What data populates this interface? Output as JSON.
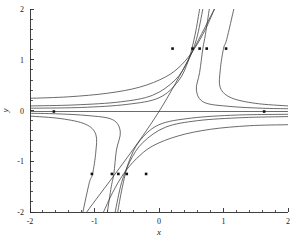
{
  "figure": {
    "background_color": "#ffffff",
    "curve_color": "#3a3a3a",
    "axis_color": "#2a2a2a",
    "marker_color": "#111111"
  },
  "chart_data": {
    "type": "line",
    "title": "",
    "subtitle": "",
    "xlabel": "x",
    "ylabel": "y",
    "xlim": [
      -2,
      2
    ],
    "ylim": [
      -2,
      2
    ],
    "grid": false,
    "legend": "none",
    "x_ticks": [
      -2,
      -1,
      0,
      1,
      2
    ],
    "x_tick_labels": [
      "-2",
      "-1",
      "0",
      "1",
      "2"
    ],
    "y_ticks": [
      -2,
      -1,
      0,
      1,
      2
    ],
    "y_tick_labels": [
      "-2",
      "-1",
      "0",
      "1",
      "2"
    ],
    "x_minor_tick_count": 4,
    "y_minor_tick_count": 4,
    "series": [
      {
        "name": "separatrix-horizontal",
        "kind": "line",
        "points": [
          [
            -2,
            -0.02
          ],
          [
            2,
            -0.02
          ]
        ]
      },
      {
        "name": "separatrix-diagonal",
        "kind": "line",
        "points": [
          [
            -1.12,
            -2.0
          ],
          [
            0.0,
            -0.02
          ],
          [
            0.86,
            2.0
          ]
        ]
      },
      {
        "name": "upper-branch-1",
        "kind": "curve",
        "points": [
          [
            -2.0,
            0.24
          ],
          [
            -1.4,
            0.27
          ],
          [
            -0.8,
            0.34
          ],
          [
            -0.3,
            0.46
          ],
          [
            0.1,
            0.66
          ],
          [
            0.35,
            0.9
          ],
          [
            0.55,
            1.22
          ],
          [
            0.72,
            1.6
          ],
          [
            0.86,
            2.0
          ]
        ]
      },
      {
        "name": "upper-branch-2",
        "kind": "curve",
        "points": [
          [
            -2.0,
            0.09
          ],
          [
            -1.3,
            0.11
          ],
          [
            -0.6,
            0.17
          ],
          [
            -0.1,
            0.3
          ],
          [
            0.25,
            0.6
          ],
          [
            0.45,
            0.98
          ],
          [
            0.58,
            1.4
          ],
          [
            0.68,
            2.0
          ]
        ]
      },
      {
        "name": "upper-branch-3",
        "kind": "curve",
        "points": [
          [
            -2.0,
            0.045
          ],
          [
            -1.2,
            0.06
          ],
          [
            -0.5,
            0.12
          ],
          [
            0.0,
            0.25
          ],
          [
            0.3,
            0.58
          ],
          [
            0.46,
            1.0
          ],
          [
            0.56,
            1.5
          ],
          [
            0.63,
            2.0
          ]
        ]
      },
      {
        "name": "right-hook-1",
        "kind": "curve",
        "points": [
          [
            0.78,
            2.0
          ],
          [
            0.72,
            1.5
          ],
          [
            0.68,
            1.22
          ],
          [
            0.63,
            0.75
          ],
          [
            0.58,
            0.4
          ],
          [
            0.7,
            0.16
          ],
          [
            1.1,
            0.08
          ],
          [
            1.6,
            0.045
          ],
          [
            2.0,
            0.035
          ]
        ]
      },
      {
        "name": "right-hook-2",
        "kind": "curve",
        "points": [
          [
            1.16,
            2.0
          ],
          [
            1.05,
            1.4
          ],
          [
            1.0,
            1.22
          ],
          [
            0.95,
            0.8
          ],
          [
            0.95,
            0.45
          ],
          [
            1.12,
            0.25
          ],
          [
            1.5,
            0.14
          ],
          [
            2.0,
            0.09
          ]
        ]
      },
      {
        "name": "lower-branch-1",
        "kind": "curve",
        "points": [
          [
            2.0,
            -0.28
          ],
          [
            1.4,
            -0.3
          ],
          [
            0.8,
            -0.37
          ],
          [
            0.3,
            -0.5
          ],
          [
            -0.1,
            -0.7
          ],
          [
            -0.35,
            -0.95
          ],
          [
            -0.55,
            -1.25
          ],
          [
            -0.72,
            -1.62
          ],
          [
            -0.86,
            -2.0
          ]
        ]
      },
      {
        "name": "lower-branch-2",
        "kind": "curve",
        "points": [
          [
            2.0,
            -0.12
          ],
          [
            1.3,
            -0.14
          ],
          [
            0.6,
            -0.2
          ],
          [
            0.1,
            -0.33
          ],
          [
            -0.25,
            -0.63
          ],
          [
            -0.45,
            -1.0
          ],
          [
            -0.58,
            -1.42
          ],
          [
            -0.68,
            -2.0
          ]
        ]
      },
      {
        "name": "lower-branch-3",
        "kind": "curve",
        "points": [
          [
            2.0,
            -0.075
          ],
          [
            1.2,
            -0.09
          ],
          [
            0.5,
            -0.15
          ],
          [
            0.0,
            -0.28
          ],
          [
            -0.3,
            -0.6
          ],
          [
            -0.47,
            -1.02
          ],
          [
            -0.57,
            -1.52
          ],
          [
            -0.64,
            -2.0
          ]
        ]
      },
      {
        "name": "left-hook-1",
        "kind": "curve",
        "points": [
          [
            -0.8,
            -2.0
          ],
          [
            -0.74,
            -1.5
          ],
          [
            -0.7,
            -1.25
          ],
          [
            -0.66,
            -0.78
          ],
          [
            -0.6,
            -0.42
          ],
          [
            -0.72,
            -0.18
          ],
          [
            -1.1,
            -0.1
          ],
          [
            -1.6,
            -0.065
          ],
          [
            -2.0,
            -0.055
          ]
        ]
      },
      {
        "name": "left-hook-2",
        "kind": "curve",
        "points": [
          [
            -1.18,
            -2.0
          ],
          [
            -1.08,
            -1.42
          ],
          [
            -1.03,
            -1.25
          ],
          [
            -0.98,
            -0.82
          ],
          [
            -0.98,
            -0.47
          ],
          [
            -1.14,
            -0.27
          ],
          [
            -1.52,
            -0.16
          ],
          [
            -2.0,
            -0.11
          ]
        ]
      }
    ],
    "markers": [
      {
        "x": 0.21,
        "y": 1.22
      },
      {
        "x": 0.52,
        "y": 1.22
      },
      {
        "x": 0.63,
        "y": 1.22
      },
      {
        "x": 0.74,
        "y": 1.22
      },
      {
        "x": 1.04,
        "y": 1.22
      },
      {
        "x": -1.63,
        "y": -0.02
      },
      {
        "x": 1.63,
        "y": -0.02
      },
      {
        "x": -1.04,
        "y": -1.25
      },
      {
        "x": -0.73,
        "y": -1.25
      },
      {
        "x": -0.63,
        "y": -1.25
      },
      {
        "x": -0.5,
        "y": -1.25
      },
      {
        "x": -0.2,
        "y": -1.25
      }
    ]
  }
}
